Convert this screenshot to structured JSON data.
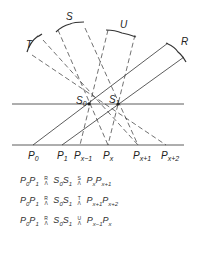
{
  "diagram": {
    "beam_labels": [
      "T",
      "S",
      "U",
      "R"
    ],
    "source_labels": {
      "s0": "S0",
      "s1": "S1"
    },
    "projection_labels": [
      "P0",
      "P1",
      "Px-1",
      "Px",
      "Px+1",
      "Px+2"
    ],
    "colors": {
      "line": "#333333",
      "background": "#ffffff"
    }
  },
  "equations": [
    {
      "lhs": "P0 P1",
      "op1_top": "R",
      "op1_bot": "Λ",
      "mid": "S0 S1",
      "op2_top": "S",
      "op2_bot": "Λ",
      "rhs": "Px Px+1"
    },
    {
      "lhs": "P0 P1",
      "op1_top": "R",
      "op1_bot": "Λ",
      "mid": "S0 S1",
      "op2_top": "T",
      "op2_bot": "Λ",
      "rhs": "Px+1 Px+2"
    },
    {
      "lhs": "P0 P1",
      "op1_top": "R",
      "op1_bot": "Λ",
      "mid": "S0 S1",
      "op2_top": "U",
      "op2_bot": "Λ",
      "rhs": "Px-1 Px"
    }
  ]
}
